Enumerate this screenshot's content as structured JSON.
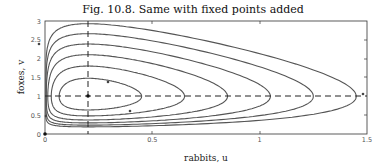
{
  "chart_data": {
    "type": "line",
    "title": "Fig. 10.8.  Same with fixed points added",
    "xlabel": "rabbits, u",
    "ylabel": "foxes, v",
    "xlim": [
      0,
      1.5
    ],
    "ylim": [
      0,
      3
    ],
    "xticks": [
      "0",
      "0.5",
      "1",
      "1.5"
    ],
    "yticks": [
      "0",
      "0.5",
      "1",
      "1.5",
      "2",
      "2.5",
      "3"
    ],
    "grid": false,
    "fixed_points": [
      {
        "u": 0,
        "v": 0
      },
      {
        "u": 0.2,
        "v": 1
      }
    ],
    "nullclines": [
      {
        "type": "vertical-dashed",
        "u": 0.2
      },
      {
        "type": "horizontal-dashed",
        "v": 1
      }
    ],
    "orbits": [
      {
        "u_max": 0.45,
        "v_max": 1.4,
        "v_min": 0.7
      },
      {
        "u_max": 0.65,
        "v_max": 1.7,
        "v_min": 0.45
      },
      {
        "u_max": 0.85,
        "v_max": 2.0,
        "v_min": 0.35
      },
      {
        "u_max": 1.05,
        "v_max": 2.3,
        "v_min": 0.28
      },
      {
        "u_max": 1.25,
        "v_max": 2.55,
        "v_min": 0.22
      },
      {
        "u_max": 1.45,
        "v_max": 2.8,
        "v_min": 0.18
      }
    ]
  }
}
